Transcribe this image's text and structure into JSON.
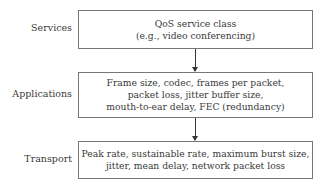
{
  "layers": [
    {
      "label": "Services",
      "lines": [
        "QoS service class",
        "(e.g., video conferencing)"
      ]
    },
    {
      "label": "Applications",
      "lines": [
        "Frame size, codec, frames per packet,",
        "packet loss, jitter buffer size,",
        "mouth-to-ear delay, FEC (redundancy)"
      ]
    },
    {
      "label": "Transport",
      "lines": [
        "Peak rate, sustainable rate, maximum burst size,",
        "jitter, mean delay, network packet loss"
      ]
    }
  ]
}
